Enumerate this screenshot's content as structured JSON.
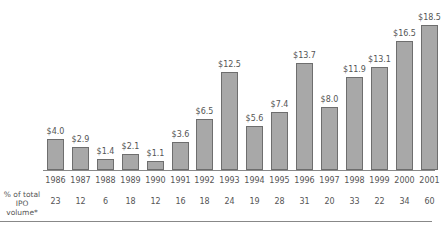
{
  "chart_data": {
    "type": "bar",
    "title": "",
    "xlabel": "",
    "ylabel": "",
    "ylim": [
      0,
      18.5
    ],
    "categories": [
      "1986",
      "1987",
      "1988",
      "1989",
      "1990",
      "1991",
      "1992",
      "1993",
      "1994",
      "1995",
      "1996",
      "1997",
      "1998",
      "1999",
      "2000",
      "2001"
    ],
    "values": [
      4.0,
      2.9,
      1.4,
      2.1,
      1.1,
      3.6,
      6.5,
      12.5,
      5.6,
      7.4,
      13.7,
      8.0,
      11.9,
      13.1,
      16.5,
      18.5
    ],
    "value_labels": [
      "$4.0",
      "$2.9",
      "$1.4",
      "$2.1",
      "$1.1",
      "$3.6",
      "$6.5",
      "$12.5",
      "$5.6",
      "$7.4",
      "$13.7",
      "$8.0",
      "$11.9",
      "$13.1",
      "$16.5",
      "$18.5"
    ],
    "grid": false,
    "legend": null,
    "table_row": {
      "label_line1": "% of total",
      "label_line2": "IPO volume*",
      "values": [
        23,
        12,
        6,
        18,
        12,
        16,
        18,
        24,
        19,
        28,
        31,
        20,
        33,
        22,
        34,
        60
      ]
    }
  },
  "colors": {
    "bar_fill": "#a8a8a8",
    "bar_border": "#6e6e6e",
    "text": "#555555"
  }
}
